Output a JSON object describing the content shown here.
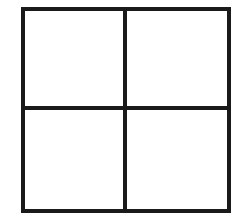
{
  "diagram": {
    "type": "grid",
    "rows": 2,
    "columns": 2,
    "line_color": "#1a1a1a",
    "fill_color": "#ffffff",
    "cells": [
      {
        "id": "top-left",
        "label": ""
      },
      {
        "id": "top-right",
        "label": ""
      },
      {
        "id": "bottom-left",
        "label": ""
      },
      {
        "id": "bottom-right",
        "label": ""
      }
    ]
  }
}
